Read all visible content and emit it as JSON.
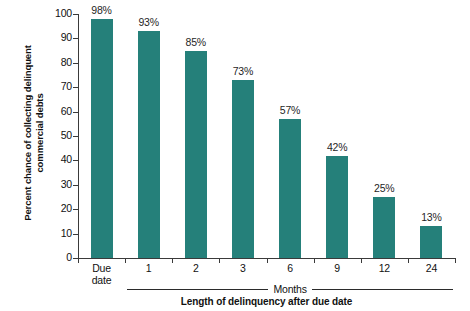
{
  "chart_data": {
    "type": "bar",
    "title": "",
    "subtitle": "",
    "categories": [
      "Due date",
      "1",
      "2",
      "3",
      "6",
      "9",
      "12",
      "24"
    ],
    "category_lines": [
      [
        "Due",
        "date"
      ],
      [
        "1"
      ],
      [
        "2"
      ],
      [
        "3"
      ],
      [
        "6"
      ],
      [
        "9"
      ],
      [
        "12"
      ],
      [
        "24"
      ]
    ],
    "values": [
      98,
      93,
      85,
      73,
      57,
      42,
      25,
      13
    ],
    "value_labels": [
      "98%",
      "93%",
      "85%",
      "73%",
      "57%",
      "42%",
      "25%",
      "13%"
    ],
    "xlabel": "Length of delinquency after due date",
    "ylabel": "Percent chance of collecting delinquent commercial debts",
    "ylabel_lines": [
      "Percent chance of collecting delinquent",
      "commercial debts"
    ],
    "ylim": [
      0,
      100
    ],
    "ytick_values": [
      0,
      10,
      20,
      30,
      40,
      50,
      60,
      70,
      80,
      90,
      100
    ],
    "ytick_labels": [
      "0",
      "10",
      "20",
      "30",
      "40",
      "50",
      "60",
      "70",
      "80",
      "90",
      "100"
    ],
    "grid": false,
    "legend": null,
    "legend_position": "none",
    "group_bracket": {
      "label": "Months",
      "spans_categories": [
        "1",
        "2",
        "3",
        "6",
        "9",
        "12",
        "24"
      ]
    },
    "colors": {
      "bar": "#25807a",
      "axis": "#3a3a3a",
      "text": "#111111",
      "background": "#ffffff"
    }
  }
}
